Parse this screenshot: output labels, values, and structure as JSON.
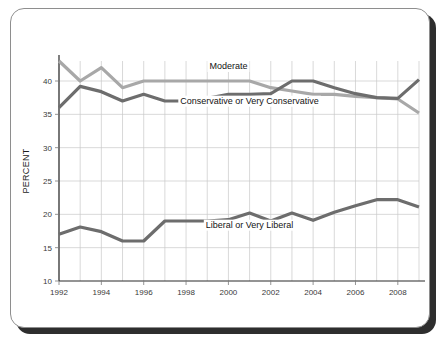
{
  "card": {
    "background": "#ffffff",
    "border_color": "#8e8e8e",
    "shadow_color": "#2e2e2e"
  },
  "chart_data": {
    "type": "line",
    "title": "",
    "subtitle": "",
    "xlabel": "",
    "ylabel": "PERCENT",
    "xlim": [
      1992,
      2009
    ],
    "ylim": [
      10,
      43
    ],
    "grid": true,
    "legend_position": "inline-labels",
    "x": [
      1992,
      1993,
      1994,
      1995,
      1996,
      1997,
      1998,
      1999,
      2000,
      2001,
      2002,
      2003,
      2004,
      2005,
      2006,
      2007,
      2008,
      2009
    ],
    "xticks": [
      1992,
      1994,
      1996,
      1998,
      2000,
      2002,
      2004,
      2006,
      2008
    ],
    "xtick_labels": [
      "1992",
      "1994",
      "1996",
      "1998",
      "2000",
      "2002",
      "2004",
      "2006",
      "2008"
    ],
    "yticks": [
      10,
      15,
      20,
      25,
      30,
      35,
      40
    ],
    "ytick_labels": [
      "10",
      "15",
      "20",
      "25",
      "30",
      "35",
      "40"
    ],
    "series": [
      {
        "name": "Moderate",
        "color": "#a8a8a8",
        "label_x": 2000,
        "label_y": 41.8,
        "values": [
          43.0,
          40.0,
          42.0,
          39.0,
          40.0,
          40.0,
          40.0,
          40.0,
          40.0,
          40.0,
          39.0,
          38.5,
          38.0,
          38.0,
          37.7,
          37.5,
          37.3,
          35.2
        ]
      },
      {
        "name": "Conservative or Very Conservative",
        "color": "#6d6d6d",
        "label_x": 2001,
        "label_y": 36.6,
        "values": [
          36.0,
          39.2,
          38.4,
          37.0,
          38.0,
          37.0,
          37.0,
          37.4,
          38.0,
          38.0,
          38.1,
          40.0,
          40.0,
          39.0,
          38.1,
          37.5,
          37.4,
          40.2
        ]
      },
      {
        "name": "Liberal or Very Liberal",
        "color": "#6d6d6d",
        "label_x": 2001,
        "label_y": 18.0,
        "values": [
          17.0,
          18.1,
          17.4,
          16.0,
          16.0,
          19.0,
          19.0,
          19.0,
          19.2,
          20.2,
          19.0,
          20.2,
          19.1,
          20.3,
          21.3,
          22.2,
          22.2,
          21.1
        ]
      }
    ]
  }
}
